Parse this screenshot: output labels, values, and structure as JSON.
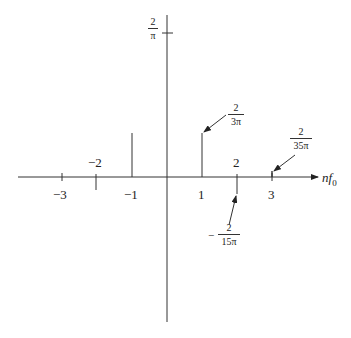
{
  "diagram": {
    "type": "line spectrum",
    "x_axis_label": "nf",
    "x_axis_subscript": "0",
    "y_tick_label": {
      "num": "2",
      "den": "π"
    },
    "tick_labels": {
      "m3": "−3",
      "m2": "−2",
      "m1": "−1",
      "p1": "1",
      "p2": "2",
      "p3": "3"
    },
    "annotations": {
      "n1": {
        "num": "2",
        "den": "3π"
      },
      "n2_sign": "−",
      "n2": {
        "num": "2",
        "den": "15π"
      },
      "n3": {
        "num": "2",
        "den": "35π"
      }
    },
    "spectral_lines": [
      {
        "n": -2,
        "value": "−2/(15π)",
        "direction": "down"
      },
      {
        "n": -1,
        "value": "2/(3π)",
        "direction": "up"
      },
      {
        "n": 0,
        "value": "2/π",
        "direction": "up"
      },
      {
        "n": 1,
        "value": "2/(3π)",
        "direction": "up"
      },
      {
        "n": 2,
        "value": "−2/(15π)",
        "direction": "down"
      },
      {
        "n": 3,
        "value": "2/(35π)",
        "direction": "up"
      }
    ]
  }
}
